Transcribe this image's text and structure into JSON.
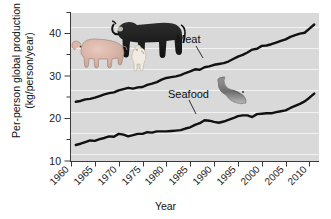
{
  "chart_data": {
    "type": "line",
    "title": "",
    "xlabel": "Year",
    "ylabel": "Per-person global production (kg/person/year)",
    "ylabel_line1": "Per-person global production",
    "ylabel_line2": "(kg/person/year)",
    "xlim": [
      1960,
      2012
    ],
    "ylim": [
      9,
      45
    ],
    "yticks": [
      10,
      20,
      30,
      40
    ],
    "yticks_minor": [
      15,
      25,
      35,
      45
    ],
    "xticks": [
      1960,
      1965,
      1970,
      1975,
      1980,
      1985,
      1990,
      1995,
      2000,
      2005,
      2010
    ],
    "grid": "horizontal-white",
    "legend": "inline-annotations",
    "plot_background": "#d9d9d9",
    "line_color": "#111111",
    "series": [
      {
        "name": "Meat",
        "label": "Meat",
        "x": [
          1961,
          1962,
          1963,
          1964,
          1965,
          1966,
          1967,
          1968,
          1969,
          1970,
          1971,
          1972,
          1973,
          1974,
          1975,
          1976,
          1977,
          1978,
          1979,
          1980,
          1981,
          1982,
          1983,
          1984,
          1985,
          1986,
          1987,
          1988,
          1989,
          1990,
          1991,
          1992,
          1993,
          1994,
          1995,
          1996,
          1997,
          1998,
          1999,
          2000,
          2001,
          2002,
          2003,
          2004,
          2005,
          2006,
          2007,
          2008,
          2009,
          2010,
          2011
        ],
        "values": [
          23.4,
          23.6,
          24.0,
          24.1,
          24.4,
          24.8,
          25.2,
          25.5,
          25.7,
          26.2,
          26.5,
          26.8,
          26.6,
          26.9,
          27.0,
          27.5,
          27.8,
          28.2,
          28.8,
          29.2,
          29.4,
          29.6,
          29.9,
          30.4,
          30.8,
          31.3,
          31.2,
          31.8,
          32.0,
          32.4,
          32.6,
          32.8,
          33.2,
          33.8,
          34.4,
          34.8,
          35.4,
          36.1,
          36.3,
          37.0,
          37.1,
          37.4,
          37.8,
          38.2,
          38.6,
          39.2,
          39.6,
          40.0,
          40.2,
          41.2,
          42.2
        ]
      },
      {
        "name": "Seafood",
        "label": "Seafood",
        "x": [
          1961,
          1962,
          1963,
          1964,
          1965,
          1966,
          1967,
          1968,
          1969,
          1970,
          1971,
          1972,
          1973,
          1974,
          1975,
          1976,
          1977,
          1978,
          1979,
          1980,
          1981,
          1982,
          1983,
          1984,
          1985,
          1986,
          1987,
          1988,
          1989,
          1990,
          1991,
          1992,
          1993,
          1994,
          1995,
          1996,
          1997,
          1998,
          1999,
          2000,
          2001,
          2002,
          2003,
          2004,
          2005,
          2006,
          2007,
          2008,
          2009,
          2010,
          2011
        ],
        "values": [
          12.9,
          13.2,
          13.6,
          14.0,
          13.9,
          14.3,
          14.6,
          15.0,
          14.9,
          15.6,
          15.4,
          15.0,
          15.3,
          15.6,
          15.6,
          16.0,
          15.9,
          16.2,
          16.2,
          16.2,
          16.3,
          16.4,
          16.5,
          16.9,
          17.2,
          17.8,
          18.2,
          18.9,
          18.8,
          18.5,
          18.3,
          18.6,
          19.0,
          19.4,
          19.9,
          20.1,
          20.1,
          19.7,
          20.4,
          20.5,
          20.6,
          20.6,
          20.9,
          21.1,
          21.3,
          21.9,
          22.4,
          22.9,
          23.5,
          24.4,
          25.4
        ]
      }
    ],
    "annotations": [
      {
        "name": "meat-illustrations",
        "items": [
          "cow",
          "pig",
          "chicken"
        ]
      },
      {
        "name": "seafood-illustration",
        "items": [
          "fish"
        ]
      }
    ]
  }
}
